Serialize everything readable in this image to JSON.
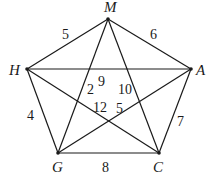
{
  "graph": {
    "vertices": {
      "M": {
        "label": "M",
        "x": 108,
        "y": 19,
        "lx": 104,
        "ly": 12
      },
      "H": {
        "label": "H",
        "x": 27,
        "y": 69,
        "lx": 9,
        "ly": 75
      },
      "A": {
        "label": "A",
        "x": 191,
        "y": 69,
        "lx": 196,
        "ly": 75
      },
      "G": {
        "label": "G",
        "x": 58,
        "y": 153,
        "lx": 52,
        "ly": 172
      },
      "C": {
        "label": "C",
        "x": 159,
        "y": 153,
        "lx": 153,
        "ly": 172
      }
    },
    "edges": [
      {
        "from": "M",
        "to": "H",
        "weight": "5",
        "wx": 62,
        "wy": 39
      },
      {
        "from": "M",
        "to": "A",
        "weight": "6",
        "wx": 150,
        "wy": 39
      },
      {
        "from": "H",
        "to": "G",
        "weight": "4",
        "wx": 27,
        "wy": 120
      },
      {
        "from": "A",
        "to": "C",
        "weight": "7",
        "wx": 177,
        "wy": 126
      },
      {
        "from": "G",
        "to": "C",
        "weight": "8",
        "wx": 102,
        "wy": 172
      },
      {
        "from": "H",
        "to": "A",
        "weight": "9",
        "wx": 98,
        "wy": 86
      },
      {
        "from": "M",
        "to": "C",
        "weight": "10",
        "wx": 118,
        "wy": 94
      },
      {
        "from": "M",
        "to": "G",
        "weight": "2",
        "wx": 87,
        "wy": 94
      },
      {
        "from": "H",
        "to": "C",
        "weight": "12",
        "wx": 93,
        "wy": 112
      },
      {
        "from": "A",
        "to": "G",
        "weight": "5",
        "wx": 116,
        "wy": 113
      }
    ]
  }
}
